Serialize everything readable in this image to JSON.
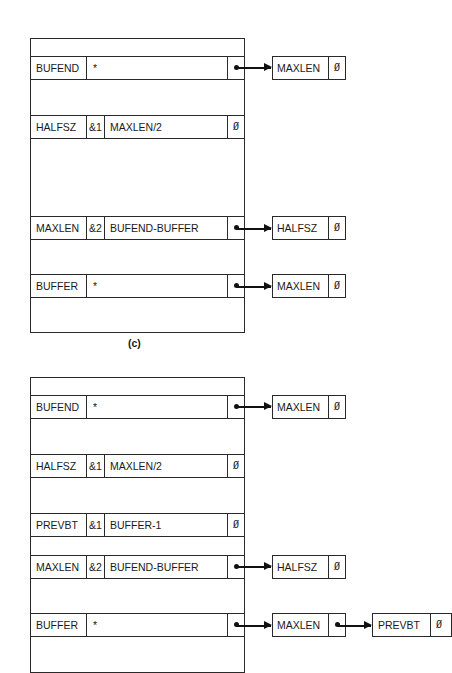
{
  "diagram_c": {
    "caption": "(c)",
    "rows": [
      {
        "name": "BUFEND",
        "flag": "",
        "expr": "*",
        "link": "pointer"
      },
      {
        "name": "HALFSZ",
        "flag": "&1",
        "expr": "MAXLEN/2",
        "link": "Ø"
      },
      {
        "name": "MAXLEN",
        "flag": "&2",
        "expr": "BUFEND-BUFFER",
        "link": "pointer"
      },
      {
        "name": "BUFFER",
        "flag": "",
        "expr": "*",
        "link": "pointer"
      }
    ],
    "refs": [
      {
        "from": "BUFEND",
        "chain": [
          {
            "name": "MAXLEN",
            "link": "Ø"
          }
        ]
      },
      {
        "from": "MAXLEN",
        "chain": [
          {
            "name": "HALFSZ",
            "link": "Ø"
          }
        ]
      },
      {
        "from": "BUFFER",
        "chain": [
          {
            "name": "MAXLEN",
            "link": "Ø"
          }
        ]
      }
    ]
  },
  "diagram_d": {
    "rows": [
      {
        "name": "BUFEND",
        "flag": "",
        "expr": "*",
        "link": "pointer"
      },
      {
        "name": "HALFSZ",
        "flag": "&1",
        "expr": "MAXLEN/2",
        "link": "Ø"
      },
      {
        "name": "PREVBT",
        "flag": "&1",
        "expr": "BUFFER-1",
        "link": "Ø"
      },
      {
        "name": "MAXLEN",
        "flag": "&2",
        "expr": "BUFEND-BUFFER",
        "link": "pointer"
      },
      {
        "name": "BUFFER",
        "flag": "",
        "expr": "*",
        "link": "pointer"
      }
    ],
    "refs": [
      {
        "from": "BUFEND",
        "chain": [
          {
            "name": "MAXLEN",
            "link": "Ø"
          }
        ]
      },
      {
        "from": "MAXLEN",
        "chain": [
          {
            "name": "HALFSZ",
            "link": "Ø"
          }
        ]
      },
      {
        "from": "BUFFER",
        "chain": [
          {
            "name": "MAXLEN",
            "link": "pointer"
          },
          {
            "name": "PREVBT",
            "link": "Ø"
          }
        ]
      }
    ]
  }
}
